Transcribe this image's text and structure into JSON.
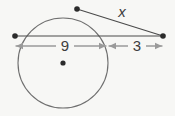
{
  "figure": {
    "background_color": "#f7f7f5",
    "circle": {
      "name": "circle-outline",
      "center_x": 63,
      "center_y": 63,
      "radius": 45,
      "stroke_color": "#6f6f6f",
      "stroke_width": 1.1
    },
    "center_dot": {
      "name": "circle-center-dot",
      "x": 63,
      "y": 63,
      "radius": 2.6,
      "color": "#2b2b2b"
    },
    "points": [
      {
        "name": "tangent-point",
        "x": 77,
        "y": 9,
        "radius": 2.8,
        "color": "#2b2b2b"
      },
      {
        "name": "secant-left-point",
        "x": 15,
        "y": 36,
        "radius": 2.8,
        "color": "#2b2b2b"
      },
      {
        "name": "external-point",
        "x": 163,
        "y": 36,
        "radius": 2.8,
        "color": "#2b2b2b"
      }
    ],
    "lines": [
      {
        "name": "tangent-segment-line",
        "x1": 77,
        "y1": 9,
        "x2": 163,
        "y2": 36,
        "stroke_color": "#4a4a4a",
        "stroke_width": 1.1
      },
      {
        "name": "secant-segment-line",
        "x1": 15,
        "y1": 36,
        "x2": 163,
        "y2": 36,
        "stroke_color": "#4a4a4a",
        "stroke_width": 1.1
      }
    ],
    "dimensions": [
      {
        "name": "dimension-diameter",
        "label": "9",
        "label_x": 65,
        "label_y": 51,
        "arrow_y": 46,
        "x_start": 16,
        "x_end": 106,
        "stroke_color": "#9a9a9a",
        "stroke_width": 1.3
      },
      {
        "name": "dimension-external",
        "label": "3",
        "label_x": 137,
        "label_y": 51,
        "arrow_y": 46,
        "x_start": 109,
        "x_end": 162,
        "stroke_color": "#9a9a9a",
        "stroke_width": 1.3
      }
    ],
    "variable_label": {
      "name": "tangent-length-label",
      "label": "x",
      "x": 122,
      "y": 17,
      "color": "#3d3d3d"
    }
  }
}
